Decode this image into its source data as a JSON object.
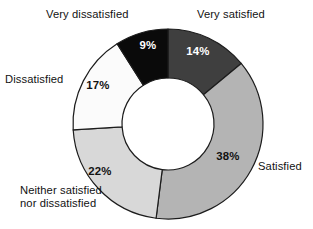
{
  "chart_data": {
    "type": "pie",
    "variant": "donut",
    "title": "",
    "subtitle": "",
    "xlabel": "",
    "ylabel": "",
    "legend_position": "outside-labels",
    "grid": false,
    "unit": "%",
    "total": 100,
    "categories": [
      "Very satisfied",
      "Satisfied",
      "Neither satisfied nor dissatisfied",
      "Dissatisfied",
      "Very dissatisfied"
    ],
    "values": [
      14,
      38,
      22,
      17,
      9
    ],
    "slices": [
      {
        "label": "Very satisfied",
        "value": 14,
        "value_text": "14%",
        "fill": "#3f3f3f",
        "text_color": "#ffffff",
        "start_angle": 0,
        "end_angle": 50.4,
        "label_pos": {
          "x": 198,
          "y": 52
        },
        "cat_label_pos": {
          "x": 197,
          "y": 8
        }
      },
      {
        "label": "Satisfied",
        "value": 38,
        "value_text": "38%",
        "fill": "#b4b4b4",
        "text_color": "#121212",
        "start_angle": 50.4,
        "end_angle": 187.2,
        "label_pos": {
          "x": 228,
          "y": 157
        },
        "cat_label_pos": {
          "x": 258,
          "y": 160
        }
      },
      {
        "label": "Neither satisfied nor dissatisfied",
        "value": 22,
        "value_text": "22%",
        "fill": "#d8d8d8",
        "text_color": "#121212",
        "start_angle": 187.2,
        "end_angle": 266.4,
        "label_pos": {
          "x": 100,
          "y": 172
        },
        "cat_label_pos": {
          "x": 20,
          "y": 184
        }
      },
      {
        "label": "Dissatisfied",
        "value": 17,
        "value_text": "17%",
        "fill": "#fbfbfb",
        "text_color": "#121212",
        "start_angle": 266.4,
        "end_angle": 327.6,
        "label_pos": {
          "x": 98,
          "y": 86
        },
        "cat_label_pos": {
          "x": 5,
          "y": 73
        }
      },
      {
        "label": "Very dissatisfied",
        "value": 9,
        "value_text": "9%",
        "fill": "#0a0a0a",
        "text_color": "#ffffff",
        "start_angle": 327.6,
        "end_angle": 360,
        "label_pos": {
          "x": 148,
          "y": 46
        },
        "cat_label_pos": {
          "x": 46,
          "y": 8
        }
      }
    ],
    "geometry": {
      "center_x": 168,
      "center_y": 124,
      "outer_radius": 95,
      "inner_radius": 46,
      "stroke": "#1c1c1c",
      "stroke_width": 1.2,
      "background": "#ffffff"
    }
  }
}
